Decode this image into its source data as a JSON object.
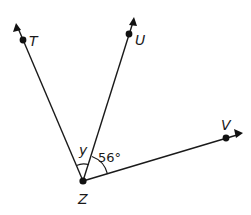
{
  "diagram": {
    "type": "angle-rays",
    "vertex": {
      "label": "Z"
    },
    "points": [
      {
        "label": "T"
      },
      {
        "label": "U"
      },
      {
        "label": "V"
      }
    ],
    "angles": [
      {
        "between": "TZU",
        "label": "y"
      },
      {
        "between": "UZV",
        "label": "56°"
      }
    ]
  }
}
